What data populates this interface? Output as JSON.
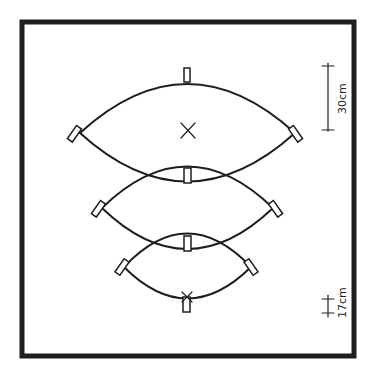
{
  "diagram": {
    "title": "",
    "elements": {
      "arcs": [
        {
          "name": "top-lens",
          "center_mark": "×"
        },
        {
          "name": "middle-lens"
        },
        {
          "name": "bottom-lens"
        }
      ]
    },
    "scale_bars": [
      {
        "label": "30cm"
      },
      {
        "label": "17cm"
      }
    ],
    "center_mark": "×",
    "colors": {
      "ink": "#1e1e1e",
      "background": "#ffffff"
    }
  }
}
